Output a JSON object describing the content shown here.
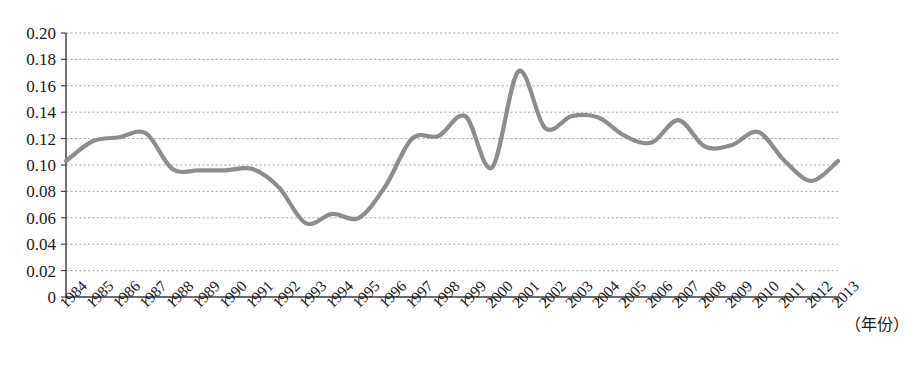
{
  "chart_data": {
    "type": "line",
    "title": "",
    "subtitle": "",
    "xlabel": "（年份）",
    "ylabel": "",
    "xlim": [
      1984,
      2013
    ],
    "ylim": [
      0,
      0.2
    ],
    "grid": true,
    "legend": null,
    "legend_position": "none",
    "line_color": "#8d8d8d",
    "x": [
      1984,
      1985,
      1986,
      1987,
      1988,
      1989,
      1990,
      1991,
      1992,
      1993,
      1994,
      1995,
      1996,
      1997,
      1998,
      1999,
      2000,
      2001,
      2002,
      2003,
      2004,
      2005,
      2006,
      2007,
      2008,
      2009,
      2010,
      2011,
      2012,
      2013
    ],
    "categories": [
      "1984",
      "1985",
      "1986",
      "1987",
      "1988",
      "1989",
      "1990",
      "1991",
      "1992",
      "1993",
      "1994",
      "1995",
      "1996",
      "1997",
      "1998",
      "1999",
      "2000",
      "2001",
      "2002",
      "2003",
      "2004",
      "2005",
      "2006",
      "2007",
      "2008",
      "2009",
      "2010",
      "2011",
      "2012",
      "2013"
    ],
    "values": [
      0.103,
      0.118,
      0.121,
      0.124,
      0.097,
      0.096,
      0.096,
      0.097,
      0.083,
      0.056,
      0.063,
      0.06,
      0.084,
      0.12,
      0.122,
      0.137,
      0.098,
      0.171,
      0.128,
      0.137,
      0.136,
      0.122,
      0.117,
      0.134,
      0.114,
      0.115,
      0.125,
      0.103,
      0.088,
      0.103
    ],
    "series": [
      {
        "name": "series-1",
        "values": [
          0.103,
          0.118,
          0.121,
          0.124,
          0.097,
          0.096,
          0.096,
          0.097,
          0.083,
          0.056,
          0.063,
          0.06,
          0.084,
          0.12,
          0.122,
          0.137,
          0.098,
          0.171,
          0.128,
          0.137,
          0.136,
          0.122,
          0.117,
          0.134,
          0.114,
          0.115,
          0.125,
          0.103,
          0.088,
          0.103
        ]
      }
    ],
    "yticks": [
      0,
      0.02,
      0.04,
      0.06,
      0.08,
      0.1,
      0.12,
      0.14,
      0.16,
      0.18,
      0.2
    ],
    "ytick_labels": [
      "0",
      "0.02",
      "0.04",
      "0.06",
      "0.08",
      "0.10",
      "0.12",
      "0.14",
      "0.16",
      "0.18",
      "0.20"
    ]
  }
}
